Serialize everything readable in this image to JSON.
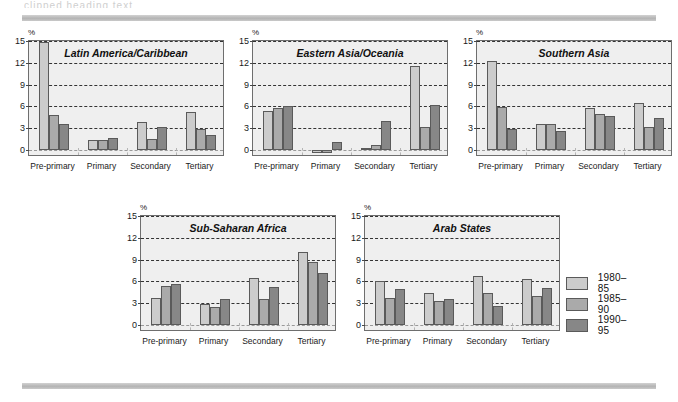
{
  "header": {
    "cut_text": "clipped heading text",
    "top_rule": "horizontal-rule",
    "bottom_rule": "horizontal-rule"
  },
  "legend": {
    "position": "right",
    "items": [
      {
        "label": "1980–85",
        "color": "#cccccc"
      },
      {
        "label": "1985–90",
        "color": "#aaaaaa"
      },
      {
        "label": "1990–95",
        "color": "#878787"
      }
    ]
  },
  "axis": {
    "unit": "%",
    "ticks": [
      "0",
      "3",
      "6",
      "9",
      "12",
      "15"
    ],
    "categories": [
      "Pre-primary",
      "Primary",
      "Secondary",
      "Tertiary"
    ]
  },
  "chart_data": [
    {
      "type": "bar",
      "title": "Latin America/Caribbean",
      "xlabel": "",
      "ylabel": "%",
      "ylim": [
        -1,
        15
      ],
      "grid": true,
      "categories": [
        "Pre-primary",
        "Primary",
        "Secondary",
        "Tertiary"
      ],
      "series": [
        {
          "name": "1980–85",
          "color": "#cccccc",
          "values": [
            14.8,
            1.4,
            3.8,
            5.2
          ]
        },
        {
          "name": "1985–90",
          "color": "#aaaaaa",
          "values": [
            4.8,
            1.4,
            1.5,
            2.9
          ]
        },
        {
          "name": "1990–95",
          "color": "#878787",
          "values": [
            3.6,
            1.6,
            3.1,
            2.0
          ]
        }
      ]
    },
    {
      "type": "bar",
      "title": "Eastern Asia/Oceania",
      "xlabel": "",
      "ylabel": "%",
      "ylim": [
        -1,
        15
      ],
      "grid": true,
      "categories": [
        "Pre-primary",
        "Primary",
        "Secondary",
        "Tertiary"
      ],
      "series": [
        {
          "name": "1980–85",
          "color": "#cccccc",
          "values": [
            5.3,
            -0.5,
            0.2,
            11.6
          ]
        },
        {
          "name": "1985–90",
          "color": "#aaaaaa",
          "values": [
            5.7,
            -0.4,
            0.6,
            3.1
          ]
        },
        {
          "name": "1990–95",
          "color": "#878787",
          "values": [
            6.0,
            1.1,
            4.0,
            6.2
          ]
        }
      ]
    },
    {
      "type": "bar",
      "title": "Southern Asia",
      "xlabel": "",
      "ylabel": "%",
      "ylim": [
        -1,
        15
      ],
      "grid": true,
      "categories": [
        "Pre-primary",
        "Primary",
        "Secondary",
        "Tertiary"
      ],
      "series": [
        {
          "name": "1980–85",
          "color": "#cccccc",
          "values": [
            12.2,
            3.5,
            5.8,
            6.4
          ]
        },
        {
          "name": "1985–90",
          "color": "#aaaaaa",
          "values": [
            5.9,
            3.6,
            4.9,
            3.2
          ]
        },
        {
          "name": "1990–95",
          "color": "#878787",
          "values": [
            2.9,
            2.6,
            4.7,
            4.4
          ]
        }
      ]
    },
    {
      "type": "bar",
      "title": "Sub-Saharan Africa",
      "xlabel": "",
      "ylabel": "%",
      "ylim": [
        -1,
        15
      ],
      "grid": true,
      "categories": [
        "Pre-primary",
        "Primary",
        "Secondary",
        "Tertiary"
      ],
      "series": [
        {
          "name": "1980–85",
          "color": "#cccccc",
          "values": [
            3.7,
            2.9,
            6.4,
            10.0
          ]
        },
        {
          "name": "1985–90",
          "color": "#aaaaaa",
          "values": [
            5.4,
            2.4,
            3.5,
            8.7
          ]
        },
        {
          "name": "1990–95",
          "color": "#878787",
          "values": [
            5.6,
            3.5,
            5.2,
            7.1
          ]
        }
      ]
    },
    {
      "type": "bar",
      "title": "Arab States",
      "xlabel": "",
      "ylabel": "%",
      "ylim": [
        -1,
        15
      ],
      "grid": true,
      "categories": [
        "Pre-primary",
        "Primary",
        "Secondary",
        "Tertiary"
      ],
      "series": [
        {
          "name": "1980–85",
          "color": "#cccccc",
          "values": [
            6.1,
            4.4,
            6.7,
            6.3
          ]
        },
        {
          "name": "1985–90",
          "color": "#aaaaaa",
          "values": [
            3.7,
            3.3,
            4.4,
            4.0
          ]
        },
        {
          "name": "1990–95",
          "color": "#878787",
          "values": [
            5.0,
            3.5,
            2.6,
            5.1
          ]
        }
      ]
    }
  ],
  "panel_layout": [
    {
      "left": 28,
      "top": 40,
      "width": 196,
      "height": 116
    },
    {
      "left": 252,
      "top": 40,
      "width": 196,
      "height": 116
    },
    {
      "left": 476,
      "top": 40,
      "width": 196,
      "height": 116
    },
    {
      "left": 140,
      "top": 215,
      "width": 196,
      "height": 116
    },
    {
      "left": 364,
      "top": 215,
      "width": 196,
      "height": 116
    }
  ],
  "legend_layout": {
    "left": 566,
    "top": 272
  }
}
